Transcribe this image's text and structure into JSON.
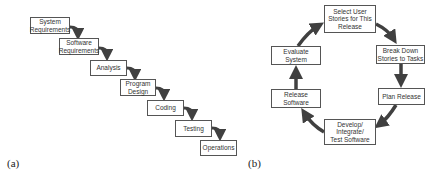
{
  "diagram_a": {
    "label": "(a)",
    "type": "waterfall",
    "steps": [
      {
        "label": "System\nRequirements"
      },
      {
        "label": "Software\nRequirements"
      },
      {
        "label": "Analysis"
      },
      {
        "label": "Program\nDesign"
      },
      {
        "label": "Coding"
      },
      {
        "label": "Testing"
      },
      {
        "label": "Operations"
      }
    ]
  },
  "diagram_b": {
    "label": "(b)",
    "type": "cycle",
    "steps": [
      {
        "label": "Select User\nStories for This\nRelease"
      },
      {
        "label": "Break Down\nStories to Tasks"
      },
      {
        "label": "Plan Release"
      },
      {
        "label": "Develop/\nIntegrate/\nTest Software"
      },
      {
        "label": "Release\nSoftware"
      },
      {
        "label": "Evaluate\nSystem"
      }
    ]
  },
  "colors": {
    "arrow": "#404040",
    "box_border": "#555555",
    "text": "#333333"
  }
}
